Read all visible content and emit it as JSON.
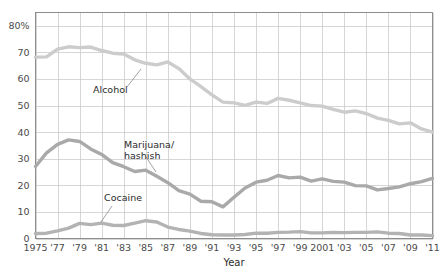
{
  "chart_data": {
    "type": "line",
    "title": "",
    "xlabel": "Year",
    "ylabel": "",
    "xlim": [
      1975,
      2011
    ],
    "ylim": [
      0,
      85
    ],
    "grid": true,
    "legend_position": "inline-annotations",
    "y_ticks": [
      {
        "value": 0,
        "label": "0"
      },
      {
        "value": 10,
        "label": "10"
      },
      {
        "value": 20,
        "label": "20"
      },
      {
        "value": 30,
        "label": "30"
      },
      {
        "value": 40,
        "label": "40"
      },
      {
        "value": 50,
        "label": "50"
      },
      {
        "value": 60,
        "label": "60"
      },
      {
        "value": 70,
        "label": "70"
      },
      {
        "value": 80,
        "label": "80%"
      }
    ],
    "x_ticks": [
      {
        "value": 1975,
        "label": "1975"
      },
      {
        "value": 1977,
        "label": "'77"
      },
      {
        "value": 1979,
        "label": "'79"
      },
      {
        "value": 1981,
        "label": "'81"
      },
      {
        "value": 1983,
        "label": "'83"
      },
      {
        "value": 1985,
        "label": "'85"
      },
      {
        "value": 1987,
        "label": "'87"
      },
      {
        "value": 1989,
        "label": "'89"
      },
      {
        "value": 1991,
        "label": "'91"
      },
      {
        "value": 1993,
        "label": "'93"
      },
      {
        "value": 1995,
        "label": "'95"
      },
      {
        "value": 1997,
        "label": "'97"
      },
      {
        "value": 1999,
        "label": "'99"
      },
      {
        "value": 2001,
        "label": "2001"
      },
      {
        "value": 2003,
        "label": "'03"
      },
      {
        "value": 2005,
        "label": "'05"
      },
      {
        "value": 2007,
        "label": "'07"
      },
      {
        "value": 2009,
        "label": "'09"
      },
      {
        "value": 2011,
        "label": "'11"
      }
    ],
    "x": [
      1975,
      1976,
      1977,
      1978,
      1979,
      1980,
      1981,
      1982,
      1983,
      1984,
      1985,
      1986,
      1987,
      1988,
      1989,
      1990,
      1991,
      1992,
      1993,
      1994,
      1995,
      1996,
      1997,
      1998,
      1999,
      2000,
      2001,
      2002,
      2003,
      2004,
      2005,
      2006,
      2007,
      2008,
      2009,
      2010,
      2011
    ],
    "series": [
      {
        "name": "Alcohol",
        "color": "#cccccc",
        "values": [
          68.2,
          68.3,
          71.2,
          72.1,
          71.8,
          72.0,
          70.7,
          69.7,
          69.4,
          67.2,
          65.9,
          65.3,
          66.4,
          63.9,
          60.0,
          57.1,
          54.0,
          51.3,
          51.0,
          50.1,
          51.3,
          50.8,
          52.7,
          52.0,
          51.0,
          50.0,
          49.8,
          48.6,
          47.5,
          48.0,
          47.0,
          45.3,
          44.4,
          43.1,
          43.5,
          41.2,
          40.0
        ]
      },
      {
        "name": "Marijuana/ hashish",
        "color": "#a9a9a9",
        "values": [
          27.1,
          32.2,
          35.4,
          37.1,
          36.5,
          33.7,
          31.6,
          28.5,
          27.0,
          25.2,
          25.7,
          23.4,
          21.0,
          18.0,
          16.7,
          14.0,
          13.8,
          11.9,
          15.5,
          19.0,
          21.2,
          21.9,
          23.7,
          22.8,
          23.1,
          21.6,
          22.4,
          21.5,
          21.2,
          19.9,
          19.8,
          18.3,
          18.8,
          19.4,
          20.6,
          21.4,
          22.6
        ]
      },
      {
        "name": "Cocaine",
        "color": "#b3b3b3",
        "values": [
          1.9,
          2.0,
          2.9,
          3.9,
          5.7,
          5.2,
          5.8,
          5.0,
          4.9,
          5.8,
          6.7,
          6.2,
          4.3,
          3.4,
          2.8,
          1.9,
          1.4,
          1.3,
          1.3,
          1.5,
          2.0,
          2.0,
          2.3,
          2.4,
          2.6,
          2.1,
          2.1,
          2.3,
          2.2,
          2.3,
          2.3,
          2.5,
          2.0,
          1.9,
          1.3,
          1.3,
          1.1
        ]
      }
    ],
    "annotations": [
      {
        "text": "Alcohol",
        "series": "Alcohol",
        "label_x": 93,
        "label_y": 93,
        "leader": {
          "x1": 127,
          "y1": 87,
          "x2": 141,
          "y2": 69
        }
      },
      {
        "text_line1": "Marijuana/",
        "text_line2": "hashish",
        "series": "Marijuana/ hashish",
        "label_x": 124,
        "label_y": 148,
        "leader": {
          "x1": 146,
          "y1": 157,
          "x2": 156,
          "y2": 172
        }
      },
      {
        "text": "Cocaine",
        "series": "Cocaine",
        "label_x": 104,
        "label_y": 201,
        "leader": {
          "x1": 112,
          "y1": 206,
          "x2": 101,
          "y2": 222
        }
      }
    ]
  },
  "axes": {
    "x_title": "Year"
  }
}
